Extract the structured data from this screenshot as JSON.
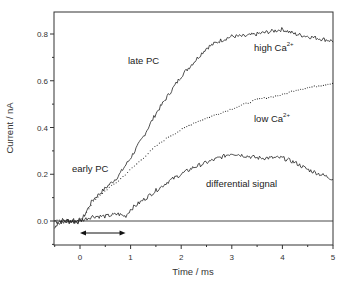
{
  "chart_data": {
    "type": "line",
    "title": "",
    "xlabel": "Time / ms",
    "ylabel": "Current / nA",
    "xlim": [
      -0.5,
      5
    ],
    "ylim": [
      -0.1,
      0.9
    ],
    "xticks": [
      "0",
      "1",
      "2",
      "3",
      "4",
      "5"
    ],
    "xtick_values": [
      0,
      1,
      2,
      3,
      4,
      5
    ],
    "yticks": [
      "0.0",
      "0.2",
      "0.4",
      "0.6",
      "0.8"
    ],
    "ytick_values": [
      0.0,
      0.2,
      0.4,
      0.6,
      0.8
    ],
    "grid": false,
    "legend": "none (inline annotations)",
    "zero_line": true,
    "series": [
      {
        "name": "high Ca2+",
        "style": "solid",
        "x": [
          -0.5,
          -0.25,
          0.0,
          0.05,
          0.25,
          0.5,
          0.75,
          1.0,
          1.25,
          1.5,
          1.75,
          2.0,
          2.25,
          2.5,
          2.75,
          3.0,
          3.25,
          3.5,
          3.75,
          4.0,
          4.25,
          4.5,
          4.75,
          5.0
        ],
        "values": [
          0.0,
          0.0,
          0.0,
          0.01,
          0.09,
          0.14,
          0.19,
          0.27,
          0.36,
          0.46,
          0.54,
          0.62,
          0.68,
          0.74,
          0.77,
          0.79,
          0.79,
          0.8,
          0.81,
          0.82,
          0.8,
          0.79,
          0.78,
          0.77
        ]
      },
      {
        "name": "low Ca2+",
        "style": "dotted",
        "x": [
          -0.5,
          -0.25,
          0.0,
          0.05,
          0.25,
          0.5,
          0.75,
          1.0,
          1.25,
          1.5,
          1.75,
          2.0,
          2.25,
          2.5,
          2.75,
          3.0,
          3.25,
          3.5,
          3.75,
          4.0,
          4.25,
          4.5,
          4.75,
          5.0
        ],
        "values": [
          0.0,
          0.0,
          0.0,
          0.01,
          0.08,
          0.13,
          0.17,
          0.22,
          0.27,
          0.32,
          0.36,
          0.39,
          0.42,
          0.44,
          0.46,
          0.48,
          0.5,
          0.52,
          0.53,
          0.54,
          0.56,
          0.57,
          0.58,
          0.59
        ]
      },
      {
        "name": "differential signal",
        "style": "solid",
        "x": [
          -0.5,
          -0.25,
          0.0,
          0.25,
          0.5,
          0.75,
          0.9,
          1.0,
          1.25,
          1.5,
          1.75,
          2.0,
          2.25,
          2.5,
          2.75,
          3.0,
          3.25,
          3.5,
          3.75,
          4.0,
          4.25,
          4.5,
          4.75,
          5.0
        ],
        "values": [
          -0.02,
          0.0,
          0.0,
          0.02,
          0.02,
          0.03,
          0.02,
          0.05,
          0.09,
          0.13,
          0.17,
          0.2,
          0.23,
          0.25,
          0.27,
          0.29,
          0.28,
          0.27,
          0.27,
          0.27,
          0.25,
          0.22,
          0.2,
          0.18
        ]
      }
    ],
    "annotations": [
      {
        "text": "late PC",
        "x": 1.0,
        "y": 0.68
      },
      {
        "text": "early PC",
        "x": -0.1,
        "y": 0.21
      },
      {
        "text": "high Ca",
        "sup": "2+",
        "x": 3.4,
        "y": 0.73
      },
      {
        "text": "low Ca",
        "sup": "2+",
        "x": 3.2,
        "y": 0.39
      },
      {
        "text": "differential signal",
        "x": 2.4,
        "y": 0.16
      }
    ],
    "double_arrow": {
      "x_start": 0.0,
      "x_end": 0.9,
      "y": -0.05
    }
  },
  "labels": {
    "xlabel": "Time / ms",
    "ylabel": "Current / nA",
    "late_pc": "late PC",
    "early_pc": "early PC",
    "high_ca": "high Ca",
    "low_ca": "low Ca",
    "ca_sup": "2+",
    "differential": "differential signal"
  },
  "colors": {
    "axis": "#333333",
    "line": "#222222",
    "background": "#ffffff"
  }
}
